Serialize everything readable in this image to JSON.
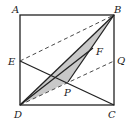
{
  "diagram": {
    "type": "geometry",
    "points": {
      "A": {
        "label": "A",
        "x": 20,
        "y": 15
      },
      "B": {
        "label": "B",
        "x": 114,
        "y": 15
      },
      "C": {
        "label": "C",
        "x": 114,
        "y": 105
      },
      "D": {
        "label": "D",
        "x": 20,
        "y": 105
      },
      "E": {
        "label": "E",
        "x": 20,
        "y": 61
      },
      "Q": {
        "label": "Q",
        "x": 114,
        "y": 61
      },
      "F": {
        "label": "F",
        "x": 93,
        "y": 48
      },
      "P": {
        "label": "P",
        "x": 68,
        "y": 82
      }
    },
    "solid_segments": [
      "AB",
      "BC",
      "CD",
      "DA",
      "EC",
      "DB",
      "DF",
      "BP"
    ],
    "dashed_segments": [
      "EB",
      "DQ"
    ],
    "shaded_region": [
      "B",
      "D",
      "P"
    ],
    "colors": {
      "line": "#222222",
      "shade": "#c8c8c8"
    }
  }
}
